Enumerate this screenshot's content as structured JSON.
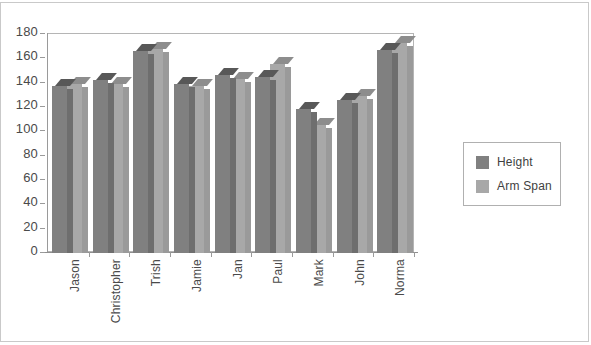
{
  "chart_data": {
    "type": "bar",
    "title": "",
    "subtitle": "",
    "xlabel": "",
    "ylabel": "",
    "ylim": [
      0,
      180
    ],
    "ytick_step": 20,
    "yticks": [
      180,
      160,
      140,
      120,
      100,
      80,
      60,
      40,
      20,
      0
    ],
    "grid": false,
    "legend_position": "right",
    "style": "3d-clustered-column",
    "categories": [
      "Jason",
      "Christopher",
      "Trish",
      "Jamie",
      "Jan",
      "Paul",
      "Mark",
      "John",
      "Norma"
    ],
    "series": [
      {
        "name": "Height",
        "color": "#808080",
        "values": [
          137,
          142,
          166,
          139,
          146,
          145,
          118,
          126,
          167
        ]
      },
      {
        "name": "Arm Span",
        "color": "#a8a8a8",
        "values": [
          139,
          139,
          168,
          137,
          143,
          155,
          105,
          129,
          173
        ]
      }
    ]
  },
  "legend": {
    "entries": [
      {
        "label": "Height",
        "color": "#808080"
      },
      {
        "label": "Arm Span",
        "color": "#a8a8a8"
      }
    ]
  },
  "axes": {
    "y": {
      "labels": [
        "180",
        "160",
        "140",
        "120",
        "100",
        "80",
        "60",
        "40",
        "20",
        "0"
      ]
    },
    "x": {
      "labels": [
        "Jason",
        "Christopher",
        "Trish",
        "Jamie",
        "Jan",
        "Paul",
        "Mark",
        "John",
        "Norma"
      ]
    }
  },
  "colors": {
    "series_height": "#808080",
    "series_arm_span": "#a8a8a8",
    "axis": "#9a9a9a",
    "frame": "#c9c9c9",
    "text": "#4a4a4a"
  }
}
